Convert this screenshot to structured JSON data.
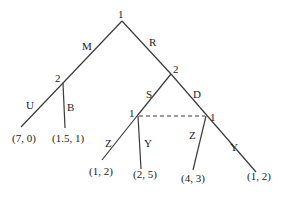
{
  "diagram": {
    "type": "extensive-form game tree",
    "line_color": "#3a3a3a",
    "text_color": "#222222",
    "nodes": [
      {
        "id": "root",
        "player": "1"
      },
      {
        "id": "n2_left",
        "player": "2"
      },
      {
        "id": "n2_right",
        "player": "2"
      },
      {
        "id": "n1_left",
        "player": "1"
      },
      {
        "id": "n1_right",
        "player": "1"
      }
    ],
    "edges": [
      {
        "from": "root",
        "to": "n2_left",
        "action": "M"
      },
      {
        "from": "root",
        "to": "n2_right",
        "action": "R"
      },
      {
        "from": "n2_left",
        "to": "leaf1",
        "action": "U"
      },
      {
        "from": "n2_left",
        "to": "leaf2",
        "action": "B"
      },
      {
        "from": "n2_right",
        "to": "n1_left",
        "action": "S"
      },
      {
        "from": "n2_right",
        "to": "n1_right",
        "action": "D"
      },
      {
        "from": "n1_left",
        "to": "leaf3",
        "action": "Z"
      },
      {
        "from": "n1_left",
        "to": "leaf4",
        "action": "Y"
      },
      {
        "from": "n1_right",
        "to": "leaf5",
        "action": "Z"
      },
      {
        "from": "n1_right",
        "to": "leaf6",
        "action": "Y"
      }
    ],
    "information_sets": [
      {
        "player": "1",
        "nodes": [
          "n1_left",
          "n1_right"
        ],
        "style": "dashed"
      }
    ],
    "payoffs": [
      {
        "leaf": "leaf1",
        "value": "(7, 0)"
      },
      {
        "leaf": "leaf2",
        "value": "(1.5, 1)"
      },
      {
        "leaf": "leaf3",
        "value": "(1, 2)"
      },
      {
        "leaf": "leaf4",
        "value": "(2, 5)"
      },
      {
        "leaf": "leaf5",
        "value": "(4, 3)"
      },
      {
        "leaf": "leaf6",
        "value": "(1, 2)"
      }
    ]
  }
}
